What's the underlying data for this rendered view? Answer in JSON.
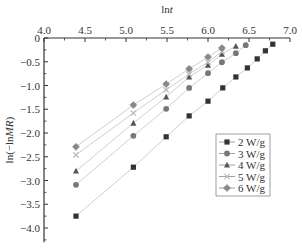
{
  "chart_data": {
    "type": "line",
    "title": "",
    "xlabel": "lnt",
    "ylabel": "ln(-lnMR)",
    "x_axis_position": "top",
    "xlim": [
      4.0,
      7.0
    ],
    "ylim": [
      -4.3,
      0
    ],
    "xticks": [
      "4.0",
      "4.5",
      "5.0",
      "5.5",
      "6.0",
      "6.5",
      "7.0"
    ],
    "yticks": [
      "0",
      "-0.5",
      "-1.0",
      "-1.5",
      "-2.0",
      "-2.5",
      "-3.0",
      "-3.5",
      "-4.0"
    ],
    "grid": false,
    "legend_position": "lower right",
    "series": [
      {
        "name": "2 W/g",
        "marker": "square",
        "color": "#333333",
        "x": [
          4.39,
          5.09,
          5.49,
          5.77,
          6.0,
          6.18,
          6.34,
          6.48,
          6.6,
          6.7,
          6.79
        ],
        "y": [
          -3.75,
          -2.72,
          -2.08,
          -1.64,
          -1.33,
          -1.05,
          -0.82,
          -0.63,
          -0.44,
          -0.27,
          -0.13
        ]
      },
      {
        "name": "3 W/g",
        "marker": "circle",
        "color": "#777777",
        "x": [
          4.39,
          5.09,
          5.49,
          5.77,
          6.0,
          6.17,
          6.34,
          6.46
        ],
        "y": [
          -3.09,
          -2.06,
          -1.49,
          -1.05,
          -0.74,
          -0.51,
          -0.32,
          -0.15
        ]
      },
      {
        "name": "4 W/g",
        "marker": "triangle",
        "color": "#555555",
        "x": [
          4.39,
          5.09,
          5.49,
          5.77,
          6.0,
          6.17,
          6.34
        ],
        "y": [
          -2.8,
          -1.79,
          -1.24,
          -0.82,
          -0.57,
          -0.34,
          -0.17
        ]
      },
      {
        "name": "5 W/g",
        "marker": "cross",
        "color": "#bbbbbb",
        "x": [
          4.39,
          5.09,
          5.49,
          5.77,
          6.0,
          6.17
        ],
        "y": [
          -2.46,
          -1.58,
          -1.09,
          -0.76,
          -0.51,
          -0.29
        ]
      },
      {
        "name": "6 W/g",
        "marker": "diamond",
        "color": "#888888",
        "x": [
          4.39,
          5.09,
          5.49,
          5.77,
          6.0,
          6.17
        ],
        "y": [
          -2.29,
          -1.41,
          -0.97,
          -0.65,
          -0.4,
          -0.21
        ]
      }
    ]
  }
}
